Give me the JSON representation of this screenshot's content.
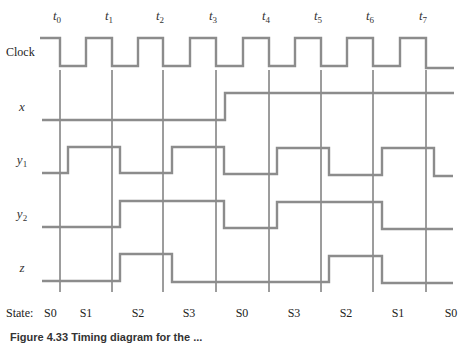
{
  "diagram": {
    "type": "timing-diagram",
    "time_markers": [
      "t0",
      "t1",
      "t2",
      "t3",
      "t4",
      "t5",
      "t6",
      "t7"
    ],
    "time_marker_x": [
      60,
      112,
      163,
      216,
      269,
      321,
      373,
      426
    ],
    "signals": [
      {
        "name": "Clock",
        "label": "Clock",
        "subscript": "",
        "high_y": 38,
        "low_y": 66,
        "points": [
          [
            40,
            38
          ],
          [
            60,
            38
          ],
          [
            60,
            66
          ],
          [
            86,
            66
          ],
          [
            86,
            38
          ],
          [
            112,
            38
          ],
          [
            112,
            66
          ],
          [
            138,
            66
          ],
          [
            138,
            38
          ],
          [
            163,
            38
          ],
          [
            163,
            66
          ],
          [
            190,
            66
          ],
          [
            190,
            38
          ],
          [
            216,
            38
          ],
          [
            216,
            66
          ],
          [
            243,
            66
          ],
          [
            243,
            38
          ],
          [
            269,
            38
          ],
          [
            269,
            66
          ],
          [
            295,
            66
          ],
          [
            295,
            38
          ],
          [
            321,
            38
          ],
          [
            321,
            66
          ],
          [
            347,
            66
          ],
          [
            347,
            38
          ],
          [
            373,
            38
          ],
          [
            373,
            66
          ],
          [
            400,
            66
          ],
          [
            400,
            38
          ],
          [
            426,
            38
          ],
          [
            426,
            68
          ],
          [
            454,
            68
          ]
        ]
      },
      {
        "name": "x",
        "label": "x",
        "subscript": "",
        "high_y": 93,
        "low_y": 120,
        "points": [
          [
            42,
            120
          ],
          [
            225,
            120
          ],
          [
            225,
            93
          ],
          [
            454,
            93
          ]
        ]
      },
      {
        "name": "y1",
        "label": "y",
        "subscript": "1",
        "high_y": 147,
        "low_y": 173,
        "points": [
          [
            42,
            173
          ],
          [
            68,
            173
          ],
          [
            68,
            147
          ],
          [
            120,
            147
          ],
          [
            120,
            173
          ],
          [
            172,
            173
          ],
          [
            172,
            147
          ],
          [
            224,
            147
          ],
          [
            224,
            174
          ],
          [
            277,
            174
          ],
          [
            277,
            148
          ],
          [
            329,
            148
          ],
          [
            329,
            175
          ],
          [
            382,
            175
          ],
          [
            382,
            148
          ],
          [
            434,
            148
          ],
          [
            434,
            176
          ],
          [
            453,
            176
          ]
        ]
      },
      {
        "name": "y2",
        "label": "y",
        "subscript": "2",
        "high_y": 201,
        "low_y": 227,
        "points": [
          [
            42,
            227
          ],
          [
            120,
            227
          ],
          [
            120,
            201
          ],
          [
            224,
            201
          ],
          [
            224,
            228
          ],
          [
            277,
            228
          ],
          [
            277,
            202
          ],
          [
            382,
            202
          ],
          [
            382,
            229
          ],
          [
            453,
            229
          ]
        ]
      },
      {
        "name": "z",
        "label": "z",
        "subscript": "",
        "high_y": 254,
        "low_y": 281,
        "points": [
          [
            42,
            281
          ],
          [
            120,
            281
          ],
          [
            120,
            254
          ],
          [
            172,
            254
          ],
          [
            172,
            282
          ],
          [
            329,
            282
          ],
          [
            329,
            256
          ],
          [
            382,
            256
          ],
          [
            382,
            283
          ],
          [
            453,
            283
          ]
        ]
      }
    ],
    "state_prefix": "State:",
    "states": [
      {
        "label": "S0",
        "x": 60
      },
      {
        "label": "S1",
        "x": 86
      },
      {
        "label": "S2",
        "x": 138
      },
      {
        "label": "S3",
        "x": 189
      },
      {
        "label": "S0",
        "x": 242
      },
      {
        "label": "S3",
        "x": 294
      },
      {
        "label": "S2",
        "x": 346
      },
      {
        "label": "S1",
        "x": 398
      },
      {
        "label": "S0",
        "x": 451
      }
    ],
    "colors": {
      "waveform": "#8c8c8c",
      "marker_line": "#3a3a3a",
      "text": "#222222"
    }
  },
  "caption": {
    "text": "Figure 4.33 Timing diagram for the ..."
  }
}
